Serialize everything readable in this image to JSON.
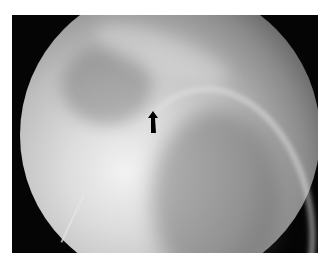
{
  "image": {
    "description": "Circular fluoroscopic radiograph on black rectangular background with a black arrow annotation pointing upward",
    "annotation": {
      "type": "arrow",
      "direction": "up",
      "color": "#000000"
    },
    "colors": {
      "background": "#ffffff",
      "frame": "#050505",
      "highlight": "#f2f2f2"
    }
  }
}
